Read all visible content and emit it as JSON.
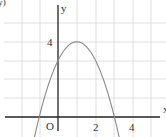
{
  "chart_data": {
    "type": "line",
    "title": "",
    "xlabel": "x",
    "ylabel": "y",
    "origin_label": "O",
    "function": "y = -(x-1)^2 + 4",
    "x_ticks": [
      {
        "value": 2,
        "label": "2"
      },
      {
        "value": 4,
        "label": "4"
      }
    ],
    "y_ticks": [
      {
        "value": 4,
        "label": "4"
      }
    ],
    "xlim": [
      -3,
      5.5
    ],
    "ylim": [
      -1,
      6
    ],
    "grid": true,
    "series": [
      {
        "name": "parabola",
        "x": [
          -1.3,
          -1,
          0,
          1,
          2,
          3,
          3.3
        ],
        "values": [
          -1.29,
          0,
          3,
          4,
          3,
          0,
          -1.29
        ]
      }
    ],
    "key_points": {
      "vertex": [
        1,
        4
      ],
      "y_intercept": [
        0,
        3
      ],
      "x_intercepts": [
        [
          -1,
          0
        ],
        [
          3,
          0
        ]
      ]
    },
    "colors": {
      "curve": "#8a8a8a",
      "axis": "#222222",
      "grid": "#d9d9d9"
    }
  },
  "labels": {
    "y_axis": "y",
    "x_axis": "x",
    "origin": "O",
    "tick_x_2": "2",
    "tick_x_4": "4",
    "tick_y_4": "4",
    "corner_fragment": ".y)"
  }
}
